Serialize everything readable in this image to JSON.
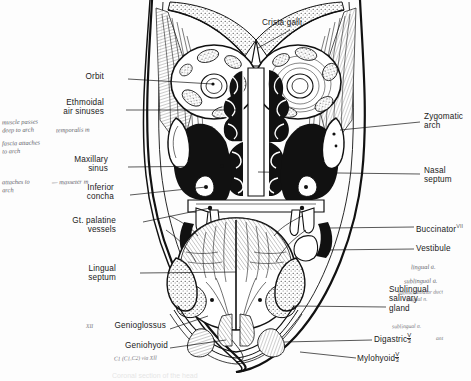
{
  "figure": {
    "title": "Coronal section of the head",
    "domain_note": "scanned anatomy textbook plate with handwritten annotations",
    "background": "#fdfdfd",
    "ink": "#111111",
    "pen": "#3a3a46"
  },
  "labels": {
    "top": [
      {
        "id": "crista-galli",
        "text": "Crista galli",
        "x": 262,
        "y": 22,
        "align": "left"
      }
    ],
    "left": [
      {
        "id": "orbit",
        "text": "Orbit",
        "x": 104,
        "y": 77,
        "align": "right"
      },
      {
        "id": "ethmoidal-air-sinuses",
        "text": "Ethmoidal\nair sinuses",
        "x": 85,
        "y": 103,
        "align": "right"
      },
      {
        "id": "maxillary-sinus",
        "text": "Maxillary\nsinus",
        "x": 88,
        "y": 160,
        "align": "right"
      },
      {
        "id": "inferior-concha",
        "text": "Inferior\nconcha",
        "x": 96,
        "y": 188,
        "align": "right"
      },
      {
        "id": "gt-palatine-vessels",
        "text": "Gt. palatine\nvessels",
        "x": 86,
        "y": 221,
        "align": "right"
      },
      {
        "id": "lingual-septum",
        "text": "Lingual\nseptum",
        "x": 96,
        "y": 269,
        "align": "right"
      },
      {
        "id": "genioglossus",
        "text": "Genioglossus",
        "x": 96,
        "y": 325,
        "align": "right"
      },
      {
        "id": "geniohyoid",
        "text": "Geniohyoid",
        "x": 110,
        "y": 345,
        "align": "right"
      }
    ],
    "right": [
      {
        "id": "zygomatic-arch",
        "text": "Zygomatic\narch",
        "x": 424,
        "y": 117,
        "align": "left"
      },
      {
        "id": "nasal-septum",
        "text": "Nasal\nseptum",
        "x": 424,
        "y": 170,
        "align": "left"
      },
      {
        "id": "buccinator",
        "text": "Buccinator",
        "x": 416,
        "y": 223,
        "align": "left",
        "sup": "VII"
      },
      {
        "id": "vestibule",
        "text": "Vestibule",
        "x": 416,
        "y": 245,
        "align": "left"
      },
      {
        "id": "sublingual-salivary-gland",
        "text": "Sublingual\nsalivary\ngland",
        "x": 389,
        "y": 290,
        "align": "left"
      },
      {
        "id": "digastric",
        "text": "Digastric",
        "x": 374,
        "y": 336,
        "align": "left",
        "frac_top": "V",
        "frac_bot": "3",
        "sup": "ant"
      },
      {
        "id": "mylohyoid",
        "text": "Mylohyoid",
        "x": 357,
        "y": 355,
        "align": "left",
        "frac_top": "V",
        "frac_bot": "3"
      }
    ]
  },
  "handwritten": [
    {
      "id": "hw-muscle-passes-deep",
      "text": "muscle passes\ndeep to arch",
      "x": 2,
      "y": 120
    },
    {
      "id": "hw-fascia-attaches",
      "text": "fascia attaches\nto arch",
      "x": 2,
      "y": 141
    },
    {
      "id": "hw-temporalis",
      "text": "temporalis m",
      "x": 56,
      "y": 127
    },
    {
      "id": "hw-attaches-to-arch",
      "text": "attaches to\narch",
      "x": 2,
      "y": 180
    },
    {
      "id": "hw-masseter",
      "text": "— masseter m",
      "x": 52,
      "y": 180
    },
    {
      "id": "hw-genioglossus-mark",
      "text": "XII",
      "x": 88,
      "y": 324
    },
    {
      "id": "hw-geniohyoid-nerve",
      "text": "C1 (C1,C2) via XII",
      "x": 116,
      "y": 356
    },
    {
      "id": "hw-lingual-a",
      "text": "lingual a.",
      "x": 411,
      "y": 265
    },
    {
      "id": "hw-sublingual-a",
      "text": "sublingual a.",
      "x": 404,
      "y": 279
    },
    {
      "id": "hw-submandibular-duct",
      "text": "submandibular duct",
      "x": 400,
      "y": 290
    },
    {
      "id": "hw-lingual-n",
      "text": "lingual n.",
      "x": 406,
      "y": 297
    },
    {
      "id": "hw-sublingual-artery",
      "text": "sublingual a.",
      "x": 392,
      "y": 324
    },
    {
      "id": "hw-digastric-ant",
      "text": "ant",
      "x": 436,
      "y": 336
    }
  ],
  "caption_faint": "Coronal section of the head"
}
